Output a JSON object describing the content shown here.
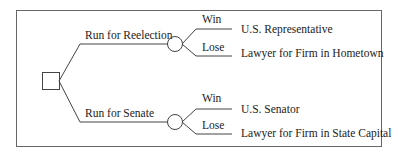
{
  "diagram": {
    "type": "decision-tree",
    "decision_node": {
      "shape": "square"
    },
    "branches": [
      {
        "label": "Run for Reelection",
        "chance_node": {
          "shape": "circle"
        },
        "outcomes": [
          {
            "event": "Win",
            "result": "U.S. Representative"
          },
          {
            "event": "Lose",
            "result": "Lawyer for Firm in Hometown"
          }
        ]
      },
      {
        "label": "Run for Senate",
        "chance_node": {
          "shape": "circle"
        },
        "outcomes": [
          {
            "event": "Win",
            "result": "U.S. Senator"
          },
          {
            "event": "Lose",
            "result": "Lawyer for Firm in State Capital"
          }
        ]
      }
    ]
  }
}
